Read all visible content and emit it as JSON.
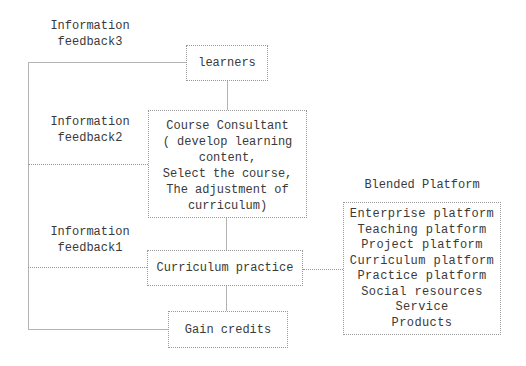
{
  "colors": {
    "text": "#3a3a3a",
    "box_border": "#999999",
    "connector_line": "#b3b3b3",
    "background": "#ffffff"
  },
  "feedback_labels": [
    {
      "line1": "Information",
      "line2": "feedback3"
    },
    {
      "line1": "Information",
      "line2": "feedback2"
    },
    {
      "line1": "Information",
      "line2": "feedback1"
    }
  ],
  "boxes": {
    "learners": {
      "label": "learners"
    },
    "course_consultant": {
      "lines": [
        "Course Consultant",
        "( develop learning",
        "content,",
        "Select the course,",
        "The adjustment of",
        "curriculum)"
      ]
    },
    "curriculum_practice": {
      "label": "Curriculum practice"
    },
    "gain_credits": {
      "label": "Gain credits"
    },
    "blended_platform": {
      "title": "Blended Platform",
      "items": [
        "Enterprise platform",
        "Teaching platform",
        "Project platform",
        "Curriculum platform",
        "Practice platform",
        "Social resources",
        "Service",
        "Products"
      ]
    }
  }
}
